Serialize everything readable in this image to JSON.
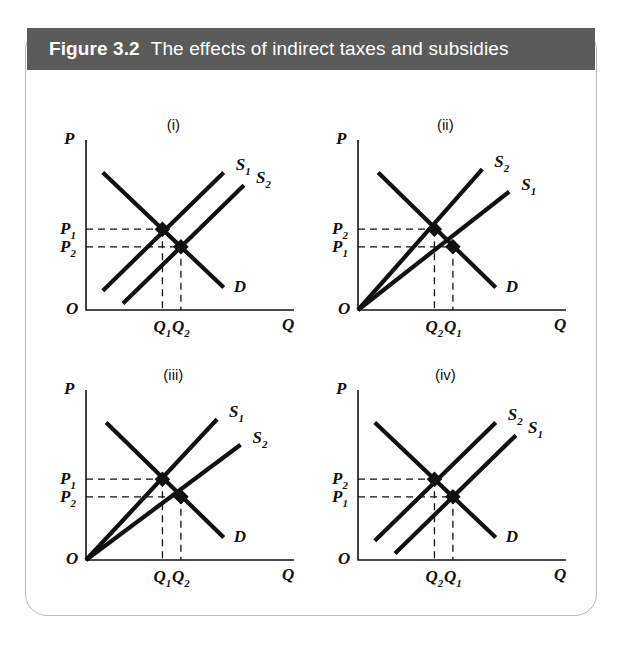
{
  "figure": {
    "number": "Figure 3.2",
    "title": "The effects of indirect taxes and subsidies",
    "header_bg": "#5b5b5b",
    "header_text_color": "#ffffff",
    "card_border_color": "#b9b9b9",
    "line_color": "#111111"
  },
  "axis_labels": {
    "price": "P",
    "quantity": "Q",
    "origin": "O"
  },
  "chart_data": [
    {
      "type": "line",
      "panel": "(i)",
      "title": "(i)",
      "xlabel": "Q",
      "ylabel": "P",
      "description": "Parallel rightward/downward shift of supply: subsidy with linear non-origin supply curves",
      "origin_label": "O",
      "curves": [
        {
          "name": "S1",
          "label": "S",
          "sub": "1",
          "kind": "supply",
          "x": [
            0.1,
            0.82
          ],
          "y": [
            0.12,
            0.86
          ]
        },
        {
          "name": "S2",
          "label": "S",
          "sub": "2",
          "kind": "supply",
          "x": [
            0.22,
            0.94
          ],
          "y": [
            0.04,
            0.78
          ]
        },
        {
          "name": "D",
          "label": "D",
          "sub": "",
          "kind": "demand",
          "x": [
            0.1,
            0.82
          ],
          "y": [
            0.86,
            0.14
          ]
        }
      ],
      "equilibria": [
        {
          "name": "E1",
          "price_label": "P",
          "price_sub": "1",
          "qty_label": "Q",
          "qty_sub": "1",
          "x": 0.455,
          "y": 0.505
        },
        {
          "name": "E2",
          "price_label": "P",
          "price_sub": "2",
          "qty_label": "Q",
          "qty_sub": "2",
          "x": 0.565,
          "y": 0.395
        }
      ],
      "price_order": "P1 > P2",
      "qty_order": "Q1 < Q2"
    },
    {
      "type": "line",
      "panel": "(ii)",
      "title": "(ii)",
      "xlabel": "Q",
      "ylabel": "P",
      "description": "Supply curves through the origin pivoting anticlockwise: indirect ad valorem tax",
      "origin_label": "O",
      "curves": [
        {
          "name": "S2",
          "label": "S",
          "sub": "2",
          "kind": "supply",
          "x": [
            0.0,
            0.74
          ],
          "y": [
            0.0,
            0.88
          ]
        },
        {
          "name": "S1",
          "label": "S",
          "sub": "1",
          "kind": "supply",
          "x": [
            0.0,
            0.9
          ],
          "y": [
            0.0,
            0.74
          ]
        },
        {
          "name": "D",
          "label": "D",
          "sub": "",
          "kind": "demand",
          "x": [
            0.12,
            0.82
          ],
          "y": [
            0.86,
            0.14
          ]
        }
      ],
      "equilibria": [
        {
          "name": "E2",
          "price_label": "P",
          "price_sub": "2",
          "qty_label": "Q",
          "qty_sub": "2",
          "x": 0.455,
          "y": 0.505
        },
        {
          "name": "E1",
          "price_label": "P",
          "price_sub": "1",
          "qty_label": "Q",
          "qty_sub": "1",
          "x": 0.565,
          "y": 0.395
        }
      ],
      "price_order": "P2 > P1",
      "qty_order": "Q2 < Q1"
    },
    {
      "type": "line",
      "panel": "(iii)",
      "title": "(iii)",
      "xlabel": "Q",
      "ylabel": "P",
      "description": "Supply curves through the origin pivoting clockwise: subsidy",
      "origin_label": "O",
      "curves": [
        {
          "name": "S1",
          "label": "S",
          "sub": "1",
          "kind": "supply",
          "x": [
            0.0,
            0.78
          ],
          "y": [
            0.0,
            0.88
          ]
        },
        {
          "name": "S2",
          "label": "S",
          "sub": "2",
          "kind": "supply",
          "x": [
            0.0,
            0.92
          ],
          "y": [
            0.0,
            0.72
          ]
        },
        {
          "name": "D",
          "label": "D",
          "sub": "",
          "kind": "demand",
          "x": [
            0.12,
            0.82
          ],
          "y": [
            0.86,
            0.14
          ]
        }
      ],
      "equilibria": [
        {
          "name": "E1",
          "price_label": "P",
          "price_sub": "1",
          "qty_label": "Q",
          "qty_sub": "1",
          "x": 0.455,
          "y": 0.505
        },
        {
          "name": "E2",
          "price_label": "P",
          "price_sub": "2",
          "qty_label": "Q",
          "qty_sub": "2",
          "x": 0.565,
          "y": 0.395
        }
      ],
      "price_order": "P1 > P2",
      "qty_order": "Q1 < Q2"
    },
    {
      "type": "line",
      "panel": "(iv)",
      "title": "(iv)",
      "xlabel": "Q",
      "ylabel": "P",
      "description": "Parallel leftward/upward shift of supply: indirect specific tax",
      "origin_label": "O",
      "curves": [
        {
          "name": "S2",
          "label": "S",
          "sub": "2",
          "kind": "supply",
          "x": [
            0.1,
            0.82
          ],
          "y": [
            0.12,
            0.86
          ]
        },
        {
          "name": "S1",
          "label": "S",
          "sub": "1",
          "kind": "supply",
          "x": [
            0.22,
            0.94
          ],
          "y": [
            0.04,
            0.78
          ]
        },
        {
          "name": "D",
          "label": "D",
          "sub": "",
          "kind": "demand",
          "x": [
            0.1,
            0.82
          ],
          "y": [
            0.86,
            0.14
          ]
        }
      ],
      "equilibria": [
        {
          "name": "E2",
          "price_label": "P",
          "price_sub": "2",
          "qty_label": "Q",
          "qty_sub": "2",
          "x": 0.455,
          "y": 0.505
        },
        {
          "name": "E1",
          "price_label": "P",
          "price_sub": "1",
          "qty_label": "Q",
          "qty_sub": "1",
          "x": 0.565,
          "y": 0.395
        }
      ],
      "price_order": "P2 > P1",
      "qty_order": "Q2 < Q1"
    }
  ]
}
